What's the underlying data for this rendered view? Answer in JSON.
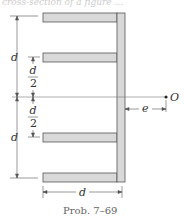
{
  "header_fragment": "cross-section of a figure ...",
  "figure": {
    "labels": {
      "d_outer_top": "d",
      "d_outer_bottom": "d",
      "d_half_num_top": "d",
      "d_half_den_top": "2",
      "d_half_num_bottom": "d",
      "d_half_den_bottom": "2",
      "width_d": "d",
      "eccentricity": "e",
      "point": "O"
    },
    "colors": {
      "member_fill": "#d9d9d9",
      "member_stroke": "#555555",
      "dimension_line": "#555555"
    }
  },
  "caption": "Prob. 7–69"
}
